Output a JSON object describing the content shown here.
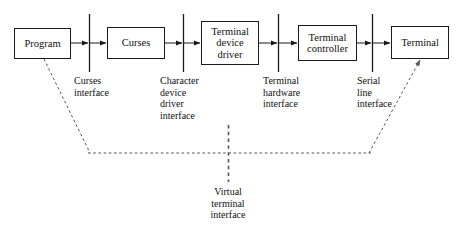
{
  "diagram": {
    "stroke_color": "#1a1a1a",
    "dash_color": "#555555",
    "background": "#ffffff",
    "nodes": [
      {
        "id": "program",
        "label": "Program"
      },
      {
        "id": "curses",
        "label": "Curses"
      },
      {
        "id": "terminal_device_driver",
        "label": "Terminal\ndevice\ndriver"
      },
      {
        "id": "terminal_controller",
        "label": "Terminal\ncontroller"
      },
      {
        "id": "terminal",
        "label": "Terminal"
      }
    ],
    "interfaces": [
      {
        "id": "curses_interface",
        "label": "Curses\ninterface"
      },
      {
        "id": "character_device_driver_interface",
        "label": "Character\ndevice\ndriver\ninterface"
      },
      {
        "id": "terminal_hardware_interface",
        "label": "Terminal\nhardware\ninterface"
      },
      {
        "id": "serial_line_interface",
        "label": "Serial\nline\ninterface"
      },
      {
        "id": "virtual_terminal_interface",
        "label": "Virtual\nterminal\ninterface"
      }
    ]
  }
}
